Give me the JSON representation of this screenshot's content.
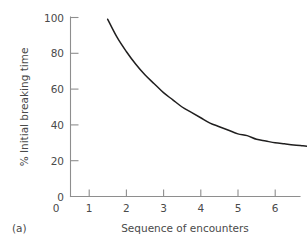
{
  "figure": {
    "panel_label": "(a)",
    "background_color": "#ffffff",
    "axis_color": "#8e8e8e",
    "curve_color": "#201f1f",
    "text_color": "#4a4a4a"
  },
  "chart_data": {
    "type": "line",
    "title": "",
    "xlabel": "Sequence of encounters",
    "ylabel": "% Initial breaking time",
    "xlim": [
      0,
      6.6
    ],
    "ylim": [
      0,
      100
    ],
    "xticks": [
      0,
      1,
      2,
      3,
      4,
      5,
      6
    ],
    "xtick_labels": [
      "0",
      "1",
      "2",
      "3",
      "4",
      "5",
      "6"
    ],
    "yticks": [
      0,
      20,
      40,
      60,
      80,
      100
    ],
    "ytick_labels": [
      "0",
      "20",
      "40",
      "60",
      "80",
      "100"
    ],
    "grid": false,
    "legend": null,
    "series": [
      {
        "name": "% initial breaking time",
        "x": [
          1.0,
          1.25,
          1.5,
          1.75,
          2.0,
          2.25,
          2.5,
          2.75,
          3.0,
          3.25,
          3.5,
          3.75,
          4.0,
          4.25,
          4.5,
          4.75,
          5.0,
          5.25,
          5.5,
          5.75,
          6.0,
          6.25,
          6.4
        ],
        "y": [
          99,
          89,
          81,
          74,
          68,
          63,
          58,
          54,
          50,
          47,
          44,
          41,
          39,
          37,
          35,
          34,
          32,
          31,
          30,
          29.4,
          28.8,
          28.3,
          28
        ]
      }
    ],
    "annotations": [
      "(a)"
    ]
  }
}
